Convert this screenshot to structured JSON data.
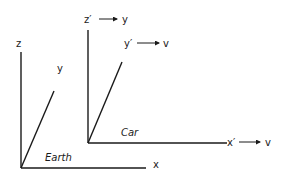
{
  "earth_frame": {
    "name": "Earth",
    "z_label": "z",
    "y_label": "y",
    "x_label": "x"
  },
  "car_frame": {
    "name": "Car",
    "z_label": "z′",
    "z_maps_to": "y",
    "y_label": "y′",
    "y_maps_to": "v",
    "x_label": "x′",
    "x_maps_to": "v"
  }
}
